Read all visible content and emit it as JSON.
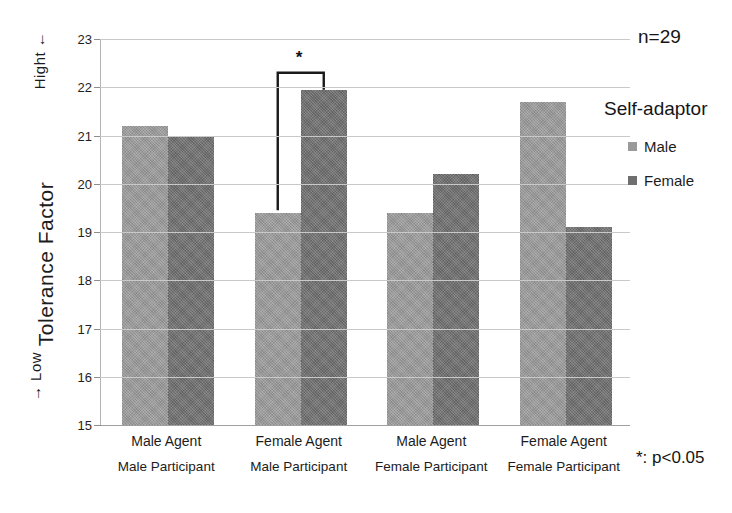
{
  "chart_data": {
    "type": "bar",
    "title": "",
    "xlabel": "",
    "ylabel": "Tolerance Factor",
    "ylim": [
      15,
      23
    ],
    "ytick_step": 1,
    "yticks": [
      23,
      22,
      21,
      20,
      19,
      18,
      17,
      16,
      15
    ],
    "grid": true,
    "legend_position": "right",
    "categories": [
      {
        "line1": "Male Agent",
        "line2": "Male Participant"
      },
      {
        "line1": "Female Agent",
        "line2": "Male Participant"
      },
      {
        "line1": "Male Agent",
        "line2": "Female Participant"
      },
      {
        "line1": "Female Agent",
        "line2": "Female Participant"
      }
    ],
    "series": [
      {
        "name": "Male",
        "color": "#9a9a9a",
        "values": [
          21.2,
          19.4,
          19.4,
          21.7
        ]
      },
      {
        "name": "Female",
        "color": "#6f6f6f",
        "values": [
          21.0,
          21.95,
          20.2,
          19.1
        ]
      }
    ],
    "annotations": {
      "sample_size": "n=29",
      "significance_note": "*: p<0.05",
      "significance_marker": "*",
      "significance_bracket": {
        "group_index": 1,
        "from_series": "Male",
        "to_series": "Female",
        "label": "*"
      }
    }
  },
  "axis": {
    "y_top_label": "Hight ←",
    "y_title": "Tolerance Factor",
    "y_bottom_label": "→ Low"
  },
  "legend": {
    "title": "Self-adaptor",
    "items": [
      {
        "label": "Male",
        "color": "#9a9a9a"
      },
      {
        "label": "Female",
        "color": "#6f6f6f"
      }
    ]
  },
  "colors": {
    "male_bar": "#9a9a9a",
    "female_bar": "#6f6f6f",
    "gridline": "#c9c9c9",
    "text": "#1c1c1c",
    "background": "#ffffff"
  }
}
